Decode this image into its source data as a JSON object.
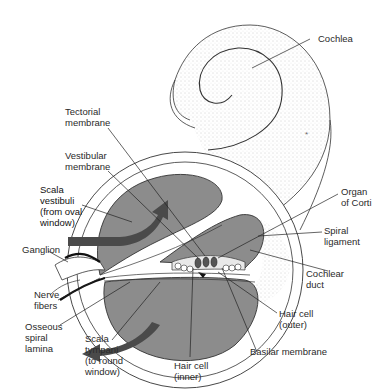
{
  "figure": {
    "colors": {
      "scala_fill": "#8c8c8c",
      "arrow": "#4a4a4a",
      "outline": "#2a2a2a",
      "stipple": "#bdbdbd",
      "background": "#ffffff"
    }
  },
  "labels": {
    "cochlea": "Cochlea",
    "tectorial_membrane": "Tectorial\nmembrane",
    "vestibular_membrane": "Vestibular\nmembrane",
    "scala_vestibuli": "Scala\nvestibuli\n(from oval\nwindow)",
    "organ_of_corti": "Organ\nof Corti",
    "spiral_ligament": "Spiral\nligament",
    "ganglion": "Ganglion",
    "cochlear_duct": "Cochlear\nduct",
    "nerve_fibers": "Nerve\nfibers",
    "osseous_spiral_lamina": "Osseous\nspiral\nlamina",
    "scala_tympani": "Scala\ntympani\n(to round\nwindow)",
    "hair_cell_outer": "Hair cell\n(outer)",
    "hair_cell_inner": "Hair cell\n(inner)",
    "basilar_membrane": "Basilar membrane"
  }
}
